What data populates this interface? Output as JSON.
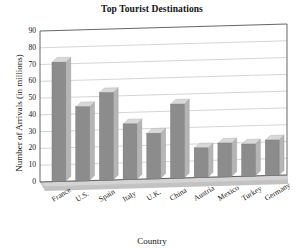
{
  "chart_data": {
    "type": "bar",
    "title": "Top Tourist Destinations",
    "xlabel": "Country",
    "ylabel": "Number of Arrivals (in millions)",
    "categories": [
      "France",
      "U.S.",
      "Spain",
      "Italy",
      "U.K.",
      "China",
      "Austria",
      "Mexico",
      "Turkey",
      "Germany"
    ],
    "values": [
      71,
      44,
      52,
      33,
      27,
      44,
      17.5,
      20,
      19,
      21
    ],
    "ylim": [
      0,
      90
    ],
    "yticks": [
      0,
      10,
      20,
      30,
      40,
      50,
      60,
      70,
      80,
      90
    ],
    "ytick_labels": [
      "0",
      "10",
      "20",
      "30",
      "40",
      "50",
      "60",
      "70",
      "80",
      "90"
    ],
    "grid": true,
    "legend": "none",
    "style": "3d-bar",
    "bar_color": "#8c8c8c",
    "bar_top_color": "#d8d8d8",
    "bar_side_color": "#b5b5b5",
    "floor_color": "#d4d4d4",
    "grid_color": "#b9b9b9",
    "axis_color": "#555555",
    "background": "#ffffff"
  }
}
